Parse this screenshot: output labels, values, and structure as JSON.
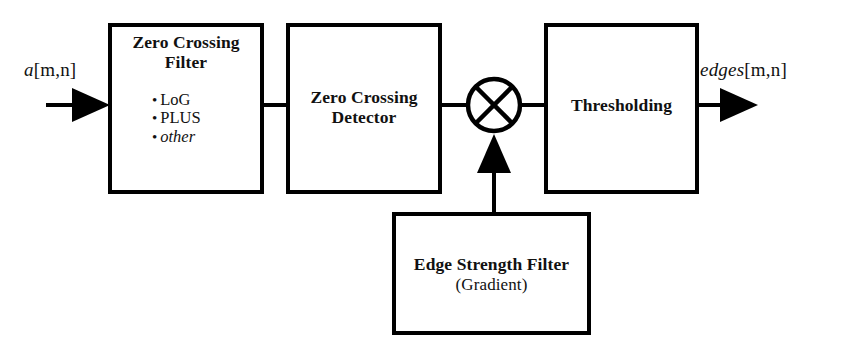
{
  "figure": {
    "type": "block-diagram",
    "background_color": "#ffffff",
    "line_color": "#000000"
  },
  "signals": {
    "input": {
      "name": "input-signal-label",
      "var": "a",
      "indices": "[m,n]",
      "full": "a[m,n]"
    },
    "output": {
      "name": "output-signal-label",
      "var": "edges",
      "indices": "[m,n]",
      "full": "edges[m,n]"
    }
  },
  "blocks": [
    {
      "id": "zero-crossing-filter",
      "title_line1": "Zero Crossing",
      "title_line2": "Filter",
      "bullets": [
        {
          "mark": "•",
          "text": "LoG",
          "italic": false
        },
        {
          "mark": "•",
          "text": "PLUS",
          "italic": false
        },
        {
          "mark": "•",
          "text": "other",
          "italic": true
        }
      ]
    },
    {
      "id": "zero-crossing-detector",
      "title_line1": "Zero Crossing",
      "title_line2": "Detector"
    },
    {
      "id": "thresholding",
      "title_line1": "Thresholding",
      "title_line2": ""
    },
    {
      "id": "edge-strength-filter",
      "title_line1": "Edge Strength Filter",
      "title_line2": "(Gradient)"
    }
  ],
  "operators": [
    {
      "id": "multiplier",
      "symbol": "×",
      "shape": "circle-with-cross"
    }
  ]
}
